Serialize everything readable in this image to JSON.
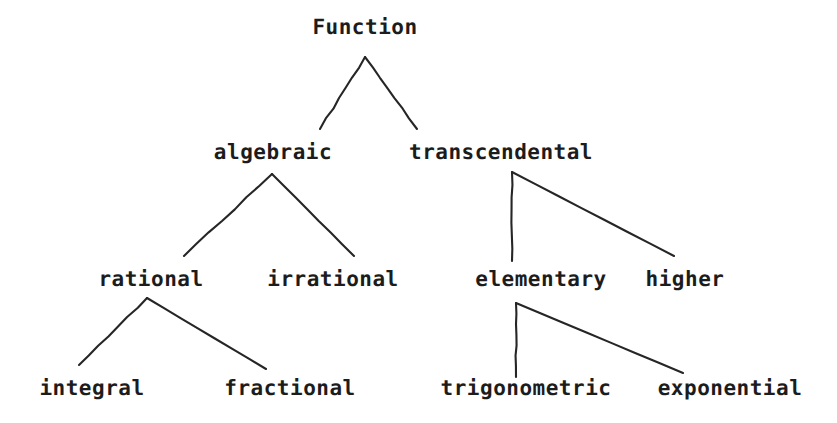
{
  "diagram": {
    "background_color": "#ffffff",
    "line_color": "#262626",
    "text_color": "#1c1c1c",
    "nodes": [
      {
        "id": "function",
        "label": "Function",
        "level": 0,
        "x": 365,
        "y": 27
      },
      {
        "id": "algebraic",
        "label": "algebraic",
        "level": 1,
        "x": 273,
        "y": 152
      },
      {
        "id": "transcendental",
        "label": "transcendental",
        "level": 1,
        "x": 501,
        "y": 152
      },
      {
        "id": "rational",
        "label": "rational",
        "level": 2,
        "x": 151,
        "y": 279
      },
      {
        "id": "irrational",
        "label": "irrational",
        "level": 2,
        "x": 333,
        "y": 279
      },
      {
        "id": "elementary",
        "label": "elementary",
        "level": 2,
        "x": 541,
        "y": 279
      },
      {
        "id": "higher",
        "label": "higher",
        "level": 2,
        "x": 685,
        "y": 279
      },
      {
        "id": "integral",
        "label": "integral",
        "level": 3,
        "x": 92,
        "y": 388
      },
      {
        "id": "fractional",
        "label": "fractional",
        "level": 3,
        "x": 290,
        "y": 388
      },
      {
        "id": "trigonometric",
        "label": "trigonometric",
        "level": 3,
        "x": 526,
        "y": 388
      },
      {
        "id": "exponential",
        "label": "exponential",
        "level": 3,
        "x": 730,
        "y": 388
      }
    ],
    "edges": [
      {
        "id": "function-algebraic",
        "from": "function",
        "to": "algebraic",
        "x1": 365,
        "y1": 57,
        "x2": 320,
        "y2": 129
      },
      {
        "id": "function-transcendental",
        "from": "function",
        "to": "transcendental",
        "x1": 365,
        "y1": 57,
        "x2": 417,
        "y2": 129
      },
      {
        "id": "algebraic-rational",
        "from": "algebraic",
        "to": "rational",
        "x1": 272,
        "y1": 174,
        "x2": 184,
        "y2": 256
      },
      {
        "id": "algebraic-irrational",
        "from": "algebraic",
        "to": "irrational",
        "x1": 272,
        "y1": 174,
        "x2": 354,
        "y2": 256
      },
      {
        "id": "transcendental-elementary",
        "from": "transcendental",
        "to": "elementary",
        "x1": 512,
        "y1": 172,
        "x2": 512,
        "y2": 261
      },
      {
        "id": "transcendental-higher",
        "from": "transcendental",
        "to": "higher",
        "x1": 512,
        "y1": 172,
        "x2": 674,
        "y2": 256
      },
      {
        "id": "rational-integral",
        "from": "rational",
        "to": "integral",
        "x1": 147,
        "y1": 298,
        "x2": 79,
        "y2": 365
      },
      {
        "id": "rational-fractional",
        "from": "rational",
        "to": "fractional",
        "x1": 147,
        "y1": 298,
        "x2": 266,
        "y2": 369
      },
      {
        "id": "elementary-trigonometric",
        "from": "elementary",
        "to": "trigonometric",
        "x1": 516,
        "y1": 303,
        "x2": 516,
        "y2": 377
      },
      {
        "id": "elementary-exponential",
        "from": "elementary",
        "to": "exponential",
        "x1": 516,
        "y1": 303,
        "x2": 683,
        "y2": 373
      }
    ]
  }
}
